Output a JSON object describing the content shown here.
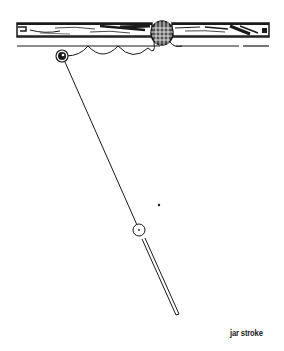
{
  "diagram": {
    "caption": "jar stroke",
    "colors": {
      "ink": "#1a1a1a",
      "background": "#ffffff"
    },
    "elements": {
      "rail": "table-rail",
      "pocket": "corner-pocket",
      "object_ball": "object-ball",
      "cue_ball": "cue-ball",
      "cue_stick": "cue-stick",
      "aim_point": "aim-dot"
    }
  }
}
